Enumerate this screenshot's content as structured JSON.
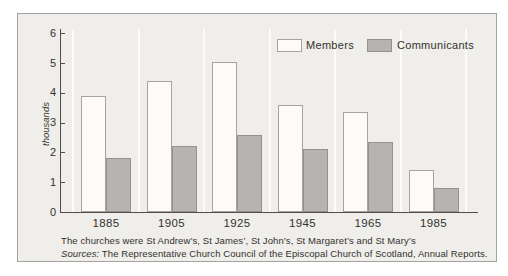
{
  "figure": {
    "caption": {
      "line1": "The churches were St Andrew’s, St James’, St John’s, St Margaret’s and St Mary’s",
      "line2_prefix": "Sources:",
      "line2_rest": " The Representative Church Council of the Episcopal Church of Scotland, Annual Reports."
    }
  },
  "chart_data": {
    "type": "bar",
    "title": "",
    "xlabel": "",
    "ylabel": "thousands",
    "categories": [
      "1885",
      "1905",
      "1925",
      "1945",
      "1965",
      "1985"
    ],
    "series": [
      {
        "name": "Members",
        "values": [
          3.9,
          4.4,
          5.05,
          3.6,
          3.35,
          1.4
        ]
      },
      {
        "name": "Communicants",
        "values": [
          1.8,
          2.2,
          2.6,
          2.1,
          2.35,
          0.8
        ]
      }
    ],
    "ylim": [
      0,
      6
    ],
    "yticks": [
      0,
      1,
      2,
      3,
      4,
      5,
      6
    ],
    "grid": "thin white vertical separators between year groups",
    "legend_position": "top-center"
  },
  "colors": {
    "frame_background": "#efeeea",
    "frame_border": "#a3a29e",
    "members_fill": "#fcfbf8",
    "members_border": "#a5a4a0",
    "communicants_fill": "#b5b4b0",
    "communicants_border": "#93928e",
    "axis": "#4f4e4a",
    "text": "#33322e",
    "separator": "#fbfbf8"
  }
}
